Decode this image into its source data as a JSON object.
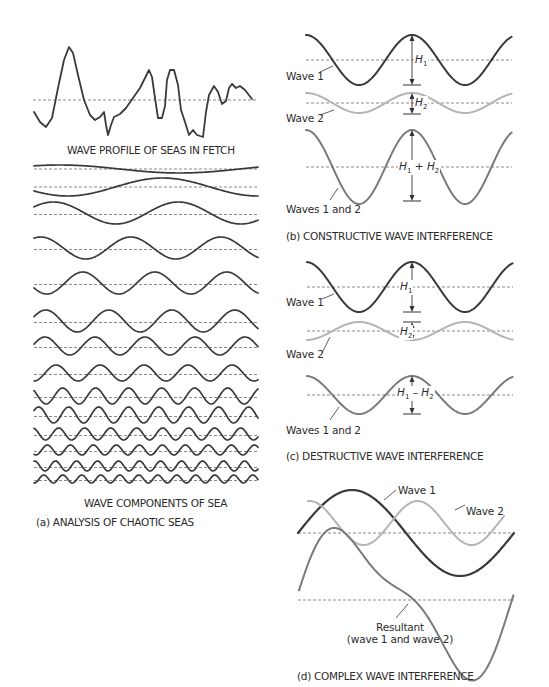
{
  "panel_a": {
    "profile_caption": "WAVE PROFILE OF SEAS IN FETCH",
    "components_caption": "WAVE COMPONENTS OF SEA",
    "title": "(a) ANALYSIS OF CHAOTIC SEAS",
    "component_count": 14
  },
  "panel_b": {
    "wave1_label": "Wave 1",
    "wave2_label": "Wave 2",
    "combined_label": "Waves 1 and 2",
    "h1": "H",
    "h1_sub": "1",
    "h2": "H",
    "h2_sub": "2",
    "sum_op": "+",
    "title": "(b) CONSTRUCTIVE WAVE INTERFERENCE"
  },
  "panel_c": {
    "wave1_label": "Wave 1",
    "wave2_label": "Wave 2",
    "combined_label": "Waves 1 and 2",
    "h1": "H",
    "h1_sub": "1",
    "h2": "H",
    "h2_sub": "2",
    "diff_op": "–",
    "title": "(c) DESTRUCTIVE WAVE INTERFERENCE"
  },
  "panel_d": {
    "wave1_label": "Wave 1",
    "wave2_label": "Wave 2",
    "resultant_label": "Resultant",
    "resultant_sub": "(wave 1 and wave 2)",
    "title": "(d) COMPLEX WAVE INTERFERENCE"
  },
  "colors": {
    "wave1": "#3a3a3a",
    "wave2": "#b4b4b4",
    "combined": "#7a7a7a",
    "dash": "#8a8a8a"
  }
}
